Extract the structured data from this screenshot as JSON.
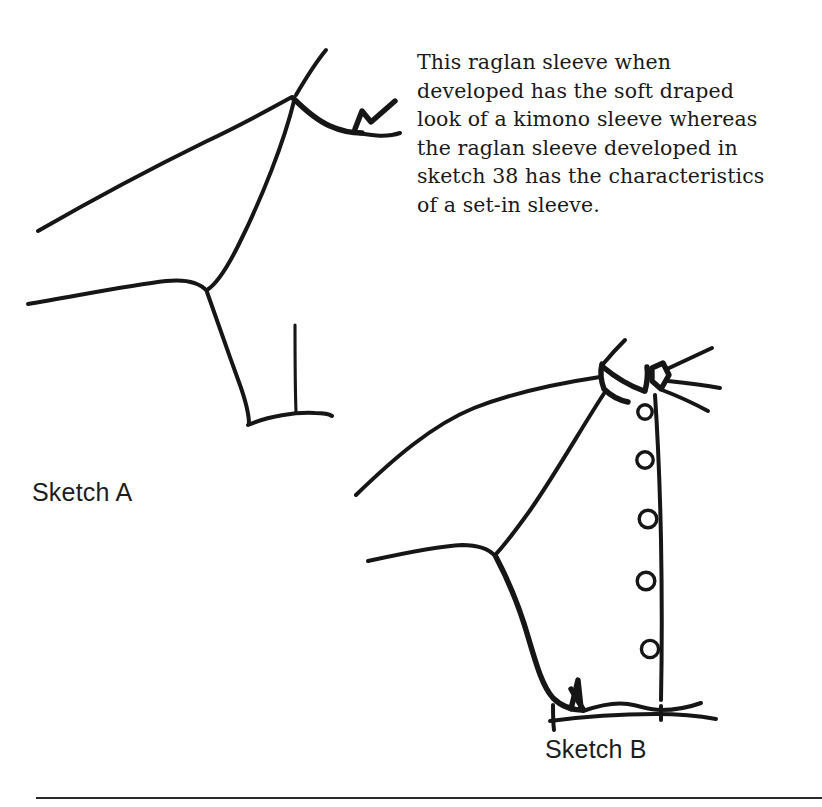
{
  "page": {
    "background_color": "#ffffff",
    "ink_color": "#161616",
    "width": 822,
    "height": 807
  },
  "caption": {
    "text": "This raglan sleeve when\ndeveloped has the soft draped\nlook of a kimono sleeve whereas\nthe raglan sleeve developed in\nsketch 38 has the characteristics\nof a set-in sleeve.",
    "lines": [
      "This raglan sleeve when",
      "developed has the soft draped",
      "look of a kimono sleeve whereas",
      "the raglan sleeve developed in",
      "sketch 38 has the characteristics",
      "of a set-in sleeve."
    ],
    "referenced_sketch_number": "38"
  },
  "sketches": [
    {
      "id": "sketch-a",
      "label": "Sketch A",
      "description": "Line drawing of a raglan sleeve bodice pattern with draped kimono-like sleeve, neckline notch, underarm seam and hem."
    },
    {
      "id": "sketch-b",
      "label": "Sketch B",
      "description": "Line drawing of a raglan sleeve bodice with collar band, centre-front placket, five buttons, curved underarm and hem with dart notch.",
      "button_count": 5
    }
  ],
  "footer": {
    "rule_color": "#2a2a2a"
  }
}
